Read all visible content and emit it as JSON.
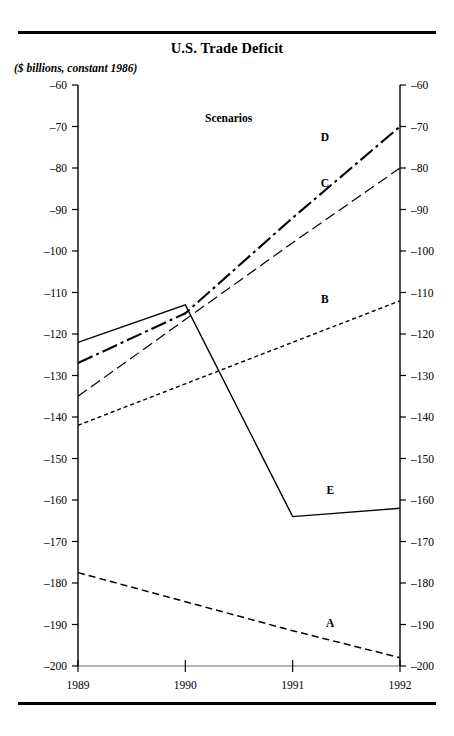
{
  "chart_data": {
    "type": "line",
    "title": "U.S. Trade Deficit",
    "subtitle": "($ billions, constant 1986)",
    "legend_title": "Scenarios",
    "legend_position": "inline-end-labels",
    "xlabel": "",
    "ylabel": "($ billions, constant 1986)",
    "x": [
      "1989",
      "1990",
      "1991",
      "1992"
    ],
    "categories": [
      "1989",
      "1990",
      "1991",
      "1992"
    ],
    "ylim": [
      -200,
      -60
    ],
    "yticks": [
      -60,
      -70,
      -80,
      -90,
      -100,
      -110,
      -120,
      -130,
      -140,
      -150,
      -160,
      -170,
      -180,
      -190,
      -200
    ],
    "ytick_labels": [
      "–60",
      "–70",
      "–80",
      "–90",
      "–100",
      "–110",
      "–120",
      "–130",
      "–140",
      "–150",
      "–160",
      "–170",
      "–180",
      "–190",
      "–200"
    ],
    "xtick_labels": [
      "1989",
      "1990",
      "1991",
      "1992"
    ],
    "grid": false,
    "dual_y_axis": true,
    "series": [
      {
        "name": "A",
        "label": "A",
        "style": "dashed",
        "dasharray": "7,4",
        "width": 1.5,
        "values": [
          -177.5,
          -184.5,
          -191.5,
          -198
        ]
      },
      {
        "name": "B",
        "label": "B",
        "style": "short-dashed",
        "dasharray": "4,3",
        "width": 1.4,
        "values": [
          -142,
          -132,
          -122,
          -112
        ]
      },
      {
        "name": "C",
        "label": "C",
        "style": "long-dashed",
        "dasharray": "11,5",
        "width": 1.2,
        "values": [
          -135,
          -116.5,
          -98,
          -80
        ]
      },
      {
        "name": "D",
        "label": "D",
        "style": "dash-dot",
        "dasharray": "16,4,3,4",
        "width": 2.1,
        "values": [
          -127,
          -115,
          -92,
          -70
        ]
      },
      {
        "name": "E",
        "label": "E",
        "style": "solid",
        "dasharray": "none",
        "width": 1.4,
        "values": [
          -122,
          -113,
          -164,
          -162
        ]
      }
    ],
    "series_label_positions": [
      {
        "name": "A",
        "x": 1991.35,
        "y": -190.5
      },
      {
        "name": "B",
        "x": 1991.3,
        "y": -112.5
      },
      {
        "name": "C",
        "x": 1991.3,
        "y": -84.5
      },
      {
        "name": "D",
        "x": 1991.3,
        "y": -73.5
      },
      {
        "name": "E",
        "x": 1991.35,
        "y": -158.5
      }
    ]
  }
}
